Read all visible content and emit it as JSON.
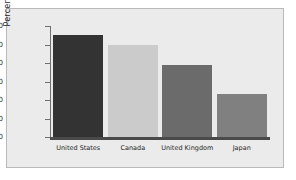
{
  "chart_data": {
    "type": "bar",
    "title": "",
    "xlabel": "",
    "ylabel": "Percentage",
    "categories": [
      "United States",
      "Canada",
      "United Kingdom",
      "Japan"
    ],
    "values": [
      55,
      50,
      39,
      23
    ],
    "colors": [
      "#333333",
      "#cbcbcb",
      "#6b6b6b",
      "#808080"
    ],
    "ylim": [
      0,
      60
    ],
    "ytick_labels": [
      "60",
      "50",
      "40",
      "30",
      "20",
      "10",
      "0"
    ],
    "ytick_values": [
      60,
      50,
      40,
      30,
      20,
      10,
      0
    ],
    "grid": false,
    "legend": "none",
    "background_color": "#ebebeb",
    "axis_color": "#6f6f6f",
    "baseline_color": "#4a4a4a",
    "border_color": "#b9b9b9"
  }
}
